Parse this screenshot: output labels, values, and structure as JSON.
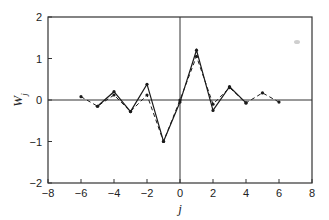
{
  "chart_data": {
    "type": "line",
    "title": "",
    "xlabel": "j",
    "ylabel": "W_j",
    "xlim": [
      -8,
      8
    ],
    "ylim": [
      -2,
      2
    ],
    "xticks": [
      -8,
      -6,
      -4,
      -2,
      0,
      2,
      4,
      6,
      8
    ],
    "yticks": [
      -2,
      -1,
      0,
      1,
      2
    ],
    "grid": false,
    "zero_lines": true,
    "legend": null,
    "x": [
      -6,
      -5,
      -4,
      -3,
      -2,
      -1,
      0,
      1,
      2,
      3,
      4,
      5,
      6
    ],
    "series": [
      {
        "name": "solid",
        "style": "solid",
        "color": "#1a1a1a",
        "x": [
          -5,
          -4,
          -3,
          -2,
          -1,
          0,
          1,
          2,
          3,
          4
        ],
        "values": [
          -0.15,
          0.2,
          -0.28,
          0.38,
          -1.0,
          -0.05,
          1.2,
          -0.25,
          0.32,
          -0.07
        ]
      },
      {
        "name": "dashed",
        "style": "dashed",
        "color": "#1a1a1a",
        "x": [
          -6,
          -5,
          -4,
          -3,
          -2,
          -1,
          0,
          1,
          2,
          3,
          4,
          5,
          6
        ],
        "values": [
          0.08,
          -0.15,
          0.12,
          -0.28,
          0.12,
          -1.0,
          0.0,
          1.05,
          -0.1,
          0.3,
          -0.07,
          0.17,
          -0.05
        ]
      }
    ]
  }
}
